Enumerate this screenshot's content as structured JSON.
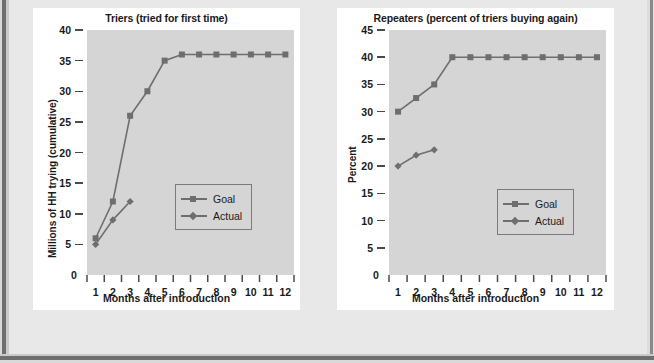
{
  "page": {
    "background_color": "#e8e8e8",
    "card_color": "#ffffff",
    "plot_color": "#d5d5d5",
    "series_color": "#6e6e6e",
    "text_color": "#1a1a1a"
  },
  "chart_data": [
    {
      "type": "line",
      "id": "triers",
      "title": "Triers (tried for first time)",
      "xlabel": "Months after introduction",
      "ylabel": "Millions of HH trying (cumulative)",
      "categories": [
        "1",
        "2",
        "3",
        "4",
        "5",
        "6",
        "7",
        "8",
        "9",
        "10",
        "11",
        "12"
      ],
      "x": [
        1,
        2,
        3,
        4,
        5,
        6,
        7,
        8,
        9,
        10,
        11,
        12
      ],
      "ylim": [
        0,
        40
      ],
      "yticks": [
        0,
        5,
        10,
        15,
        20,
        25,
        30,
        35,
        40
      ],
      "grid": false,
      "legend_position": "center-right",
      "series": [
        {
          "name": "Goal",
          "marker": "square",
          "values": [
            6,
            12,
            26,
            30,
            35,
            36,
            36,
            36,
            36,
            36,
            36,
            36
          ]
        },
        {
          "name": "Actual",
          "marker": "diamond",
          "values": [
            5,
            9,
            12,
            null,
            null,
            null,
            null,
            null,
            null,
            null,
            null,
            null
          ]
        }
      ]
    },
    {
      "type": "line",
      "id": "repeaters",
      "title": "Repeaters (percent of triers buying again)",
      "xlabel": "Months after introduction",
      "ylabel": "Percent",
      "categories": [
        "1",
        "2",
        "3",
        "4",
        "5",
        "6",
        "7",
        "8",
        "9",
        "10",
        "11",
        "12"
      ],
      "x": [
        1,
        2,
        3,
        4,
        5,
        6,
        7,
        8,
        9,
        10,
        11,
        12
      ],
      "ylim": [
        0,
        45
      ],
      "yticks": [
        0,
        5,
        10,
        15,
        20,
        25,
        30,
        35,
        40,
        45
      ],
      "grid": false,
      "legend_position": "center-right",
      "series": [
        {
          "name": "Goal",
          "marker": "square",
          "values": [
            30,
            32.5,
            35,
            40,
            40,
            40,
            40,
            40,
            40,
            40,
            40,
            40
          ]
        },
        {
          "name": "Actual",
          "marker": "diamond",
          "values": [
            20,
            22,
            23,
            null,
            null,
            null,
            null,
            null,
            null,
            null,
            null,
            null
          ]
        }
      ]
    }
  ]
}
